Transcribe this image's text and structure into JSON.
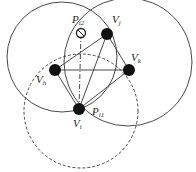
{
  "diagram": {
    "nodes": [
      {
        "id": "Vh",
        "label": "V",
        "sub": "h",
        "kind": "filled"
      },
      {
        "id": "Vj",
        "label": "V",
        "sub": "j",
        "kind": "filled"
      },
      {
        "id": "Vk",
        "label": "V",
        "sub": "k",
        "kind": "filled"
      },
      {
        "id": "Vi",
        "label": "V",
        "sub": "i",
        "kind": "filled"
      },
      {
        "id": "Pi2",
        "label": "P",
        "sub": "i2",
        "kind": "hollow"
      },
      {
        "id": "Pi1",
        "label": "P",
        "sub": "i1",
        "kind": "point"
      }
    ],
    "edges": [
      {
        "from": "Vh",
        "to": "Vj",
        "style": "solid"
      },
      {
        "from": "Vh",
        "to": "Vk",
        "style": "solid"
      },
      {
        "from": "Vh",
        "to": "Vi",
        "style": "solid"
      },
      {
        "from": "Vj",
        "to": "Vk",
        "style": "solid"
      },
      {
        "from": "Vj",
        "to": "Vi",
        "style": "solid"
      },
      {
        "from": "Vk",
        "to": "Vi",
        "style": "solid"
      },
      {
        "from": "Vi",
        "to": "Pi2",
        "style": "dash-dot"
      }
    ],
    "circles": [
      {
        "name": "left-circle",
        "style": "solid"
      },
      {
        "name": "right-circle",
        "style": "solid"
      },
      {
        "name": "lower-circle",
        "style": "dashed"
      }
    ]
  }
}
